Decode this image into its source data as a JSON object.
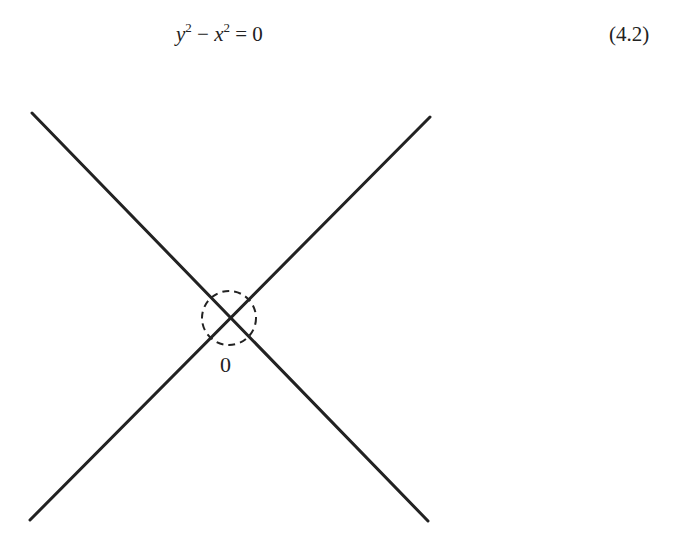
{
  "equation": {
    "y_var": "y",
    "y_exp": "2",
    "minus": " − ",
    "x_var": "x",
    "x_exp": "2",
    "equals": " = ",
    "rhs": "0",
    "number": "(4.2)"
  },
  "figure": {
    "origin_label": "0",
    "line_color": "#222222",
    "lines": [
      {
        "name": "y-equals-minus-x",
        "x1": 32,
        "y1": 113,
        "x2": 428,
        "y2": 521
      },
      {
        "name": "y-equals-x",
        "x1": 30,
        "y1": 520,
        "x2": 430,
        "y2": 117
      }
    ],
    "circle": {
      "cx": 229,
      "cy": 318,
      "r": 27,
      "style": "dashed"
    }
  }
}
